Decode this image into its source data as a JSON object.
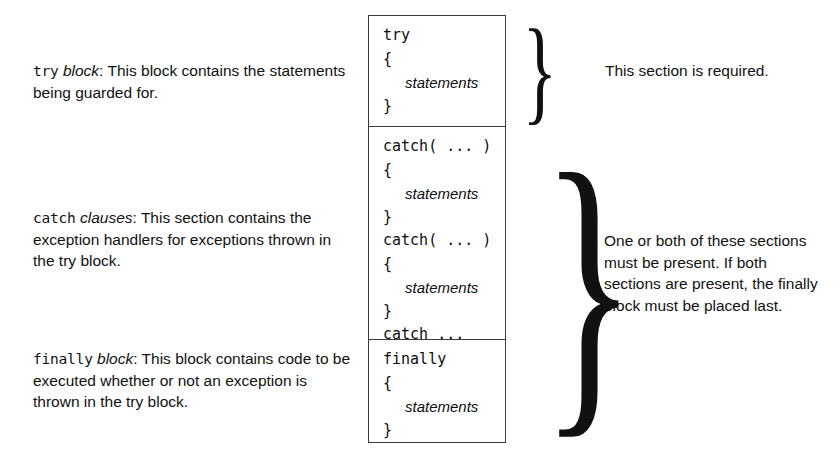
{
  "diagram": {
    "descriptions": [
      {
        "keyword": "try",
        "emphasis": "block",
        "separator": ": ",
        "text": "This block contains the statements being guarded for."
      },
      {
        "keyword": "catch",
        "emphasis": "clauses",
        "separator": ": ",
        "text": "This section contains the exception handlers for exceptions thrown in the try block."
      },
      {
        "keyword": "finally",
        "emphasis": "block",
        "separator": ": ",
        "text": "This block contains code to be executed whether or not an exception is thrown in the try block."
      }
    ],
    "code_sections": [
      {
        "name": "try-section",
        "lines": [
          {
            "text": "try",
            "style": "code"
          },
          {
            "text": "{",
            "style": "code"
          },
          {
            "text": "statements",
            "style": "italic"
          },
          {
            "text": "}",
            "style": "code"
          }
        ]
      },
      {
        "name": "catch-section",
        "lines": [
          {
            "text": "catch( ... )",
            "style": "code"
          },
          {
            "text": "{",
            "style": "code"
          },
          {
            "text": "statements",
            "style": "italic"
          },
          {
            "text": "}",
            "style": "code"
          },
          {
            "text": "catch( ... )",
            "style": "code"
          },
          {
            "text": "{",
            "style": "code"
          },
          {
            "text": "statements",
            "style": "italic"
          },
          {
            "text": "}",
            "style": "code"
          },
          {
            "text": "catch ...",
            "style": "code"
          }
        ]
      },
      {
        "name": "finally-section",
        "lines": [
          {
            "text": "finally",
            "style": "code"
          },
          {
            "text": "{",
            "style": "code"
          },
          {
            "text": "statements",
            "style": "italic"
          },
          {
            "text": "}",
            "style": "code"
          }
        ]
      }
    ],
    "annotations": [
      {
        "name": "required-note",
        "text": "This section is required.",
        "brace": "}"
      },
      {
        "name": "one-or-both-note",
        "text": "One or both of these sections must be present. If both sections are present, the finally block must be placed last.",
        "brace": "}"
      }
    ],
    "colors": {
      "border": "#3a3a3a",
      "text": "#111111",
      "background": "#ffffff"
    }
  }
}
